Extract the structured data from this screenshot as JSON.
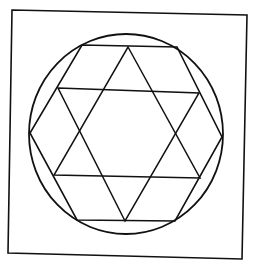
{
  "diagram": {
    "width": 257,
    "height": 265,
    "background": "#ffffff",
    "stroke_color": "#111111",
    "frame": {
      "points": [
        [
          12,
          10
        ],
        [
          247,
          15
        ],
        [
          242,
          259
        ],
        [
          8,
          253
        ]
      ],
      "stroke_width": 1.6
    },
    "circle": {
      "cx": 126,
      "cy": 134,
      "rx": 97,
      "ry": 100,
      "stroke_width": 1.8
    },
    "hexagon": {
      "points": [
        [
          82,
          45
        ],
        [
          177,
          47
        ],
        [
          222,
          137
        ],
        [
          175,
          221
        ],
        [
          77,
          220
        ],
        [
          30,
          133
        ]
      ],
      "stroke_width": 1.6
    },
    "star": {
      "up_triangle": {
        "points": [
          [
            128,
            47
          ],
          [
            200,
            178
          ],
          [
            54,
            175
          ]
        ]
      },
      "down_triangle": {
        "points": [
          [
            58,
            88
          ],
          [
            199,
            93
          ],
          [
            125,
            221
          ]
        ]
      },
      "stroke_width": 1.5
    }
  }
}
